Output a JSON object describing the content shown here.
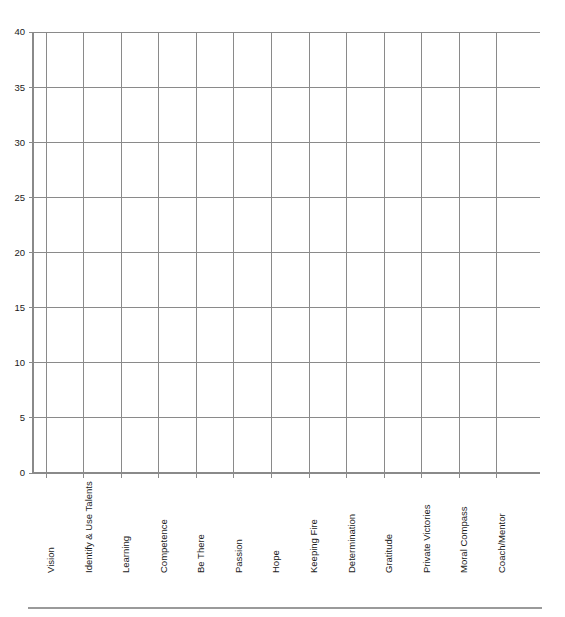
{
  "chart_data": {
    "type": "bar",
    "title": "",
    "subtitle": "",
    "xlabel": "",
    "ylabel": "",
    "categories": [
      "Vision",
      "Identify & Use Talents",
      "Learning",
      "Competence",
      "Be There",
      "Passion",
      "Hope",
      "Keeping Fire",
      "Determination",
      "Gratitude",
      "Private Victories",
      "Moral Compass",
      "Coach/Mentor"
    ],
    "values": [
      0,
      0,
      0,
      0,
      0,
      0,
      0,
      0,
      0,
      0,
      0,
      0,
      0
    ],
    "ylim": [
      0,
      40
    ],
    "ytick_values": [
      0,
      5,
      10,
      15,
      20,
      25,
      30,
      35,
      40
    ],
    "ytick_labels": [
      "0",
      "5",
      "10",
      "15",
      "20",
      "25",
      "30",
      "35",
      "40"
    ],
    "ytick_step": 5,
    "grid": true,
    "grid_axis": "both",
    "legend": false,
    "legend_position": "none",
    "annotations": []
  },
  "axes": {
    "y_axis_name": "value-axis",
    "x_axis_name": "category-axis",
    "x_label_rotation": -90
  },
  "colors": {
    "background": "#ffffff",
    "grid": "#8a8a8a",
    "axis": "#8a8a8a",
    "text": "#1a1a1a",
    "footer_rule": "#9a9a9a"
  },
  "footer": {
    "rule_present": true
  }
}
